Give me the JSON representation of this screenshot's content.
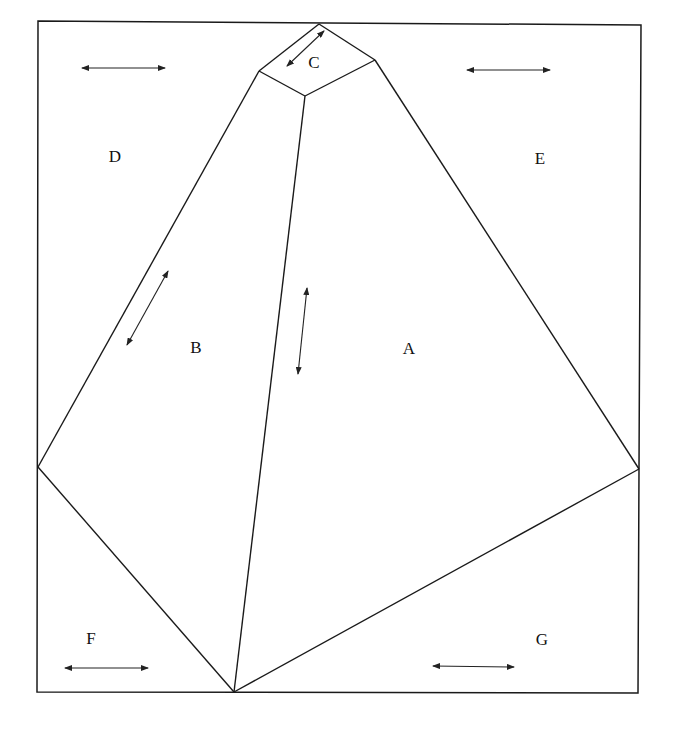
{
  "diagram": {
    "frame": {
      "points": [
        [
          38,
          21
        ],
        [
          641,
          25
        ],
        [
          638,
          693
        ],
        [
          37,
          692
        ]
      ]
    },
    "vertices": {
      "top": [
        319,
        24
      ],
      "c_left": [
        259,
        71
      ],
      "c_bottom": [
        305,
        96
      ],
      "c_right": [
        375,
        60
      ],
      "left": [
        38,
        467
      ],
      "right": [
        639,
        469
      ],
      "bottom": [
        234,
        692
      ]
    },
    "regions": [
      {
        "id": "A",
        "label": "A",
        "pos": [
          409,
          350
        ]
      },
      {
        "id": "B",
        "label": "B",
        "pos": [
          196,
          349
        ]
      },
      {
        "id": "C",
        "label": "C",
        "pos": [
          314,
          64
        ]
      },
      {
        "id": "D",
        "label": "D",
        "pos": [
          115,
          158
        ]
      },
      {
        "id": "E",
        "label": "E",
        "pos": [
          540,
          160
        ]
      },
      {
        "id": "F",
        "label": "F",
        "pos": [
          91,
          640
        ]
      },
      {
        "id": "G",
        "label": "G",
        "pos": [
          542,
          641
        ]
      }
    ],
    "arrows": [
      {
        "region": "D",
        "from": [
          82,
          68
        ],
        "to": [
          165,
          68
        ]
      },
      {
        "region": "E",
        "from": [
          467,
          70
        ],
        "to": [
          550,
          70
        ]
      },
      {
        "region": "C",
        "from": [
          324,
          31
        ],
        "to": [
          287,
          66
        ]
      },
      {
        "region": "B",
        "from": [
          168,
          271
        ],
        "to": [
          127,
          345
        ]
      },
      {
        "region": "A",
        "from": [
          307,
          288
        ],
        "to": [
          298,
          374
        ]
      },
      {
        "region": "F",
        "from": [
          65,
          668
        ],
        "to": [
          148,
          668
        ]
      },
      {
        "region": "G",
        "from": [
          433,
          666
        ],
        "to": [
          514,
          667
        ]
      }
    ]
  }
}
